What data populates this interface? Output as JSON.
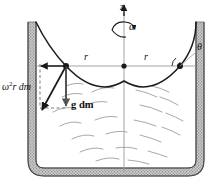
{
  "figure": {
    "domain": "physics-free-body-diagram",
    "width": 215,
    "height": 183,
    "background": "#ffffff",
    "ink_color": "#1a1a1a",
    "wall_fill": "#bdbdbd",
    "guide_color": "#9a9a9a",
    "fluid_streak_color": "#a8a8a8"
  },
  "labels": {
    "axis_z": "z",
    "omega": "ω",
    "radius_left": "r",
    "radius_right": "r",
    "theta": "θ",
    "centrifugal_force_base": "r dm",
    "centrifugal_force_symbol": "ω",
    "centrifugal_force_exponent": "2",
    "gravity_force": "g dm"
  },
  "geometry": {
    "axis_x": 124,
    "surface_vertex_y": 81,
    "reference_line_y": 66,
    "reference_line_x1": 36,
    "reference_line_x2": 196,
    "left_contact_point": [
      66,
      66
    ],
    "center_point": [
      124,
      66
    ],
    "right_contact_point": [
      180,
      66
    ],
    "container_inner_left": 36,
    "container_inner_right": 196,
    "container_top_y": 22,
    "container_bottom_y": 172
  },
  "elements": {
    "z_axis_arrow": "vertical upward arrow on rotation axis",
    "omega_arrow": "curved arrow indicating rotation sense about z",
    "free_surface": "parabolic curve (paraboloid of revolution cross-section)",
    "reference_line": "horizontal chord through contact points",
    "centrifugal_vector": "horizontal arrow pointing outward (left) from mass element",
    "gravity_vector": "vertical arrow pointing downward from mass element",
    "resultant_vector": "diagonal arrow down-outward, sum of the two forces",
    "construction_lines": "dashed parallelogram completing the vector sum",
    "theta_angle": "angle between free-surface tangent and horizontal at wall",
    "fluid_streaks": "short curved dashes indicating the rotating liquid body",
    "container_walls": "hatched double-line cylindrical vessel with rounded base"
  }
}
